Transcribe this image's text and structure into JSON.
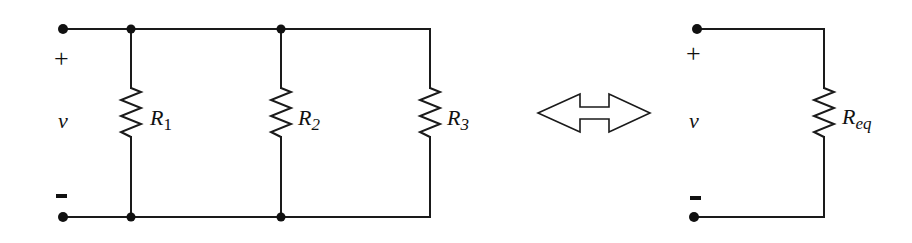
{
  "diagram": {
    "left_circuit": {
      "polarity_plus": "+",
      "polarity_minus": "-",
      "voltage_label": "v",
      "resistors": [
        {
          "name": "R",
          "subscript": "1"
        },
        {
          "name": "R",
          "subscript": "2"
        },
        {
          "name": "R",
          "subscript": "3"
        }
      ]
    },
    "equivalence_arrow": "double-headed hollow arrow",
    "right_circuit": {
      "polarity_plus": "+",
      "polarity_minus": "-",
      "voltage_label": "v",
      "resistor": {
        "name": "R",
        "subscript": "eq"
      }
    },
    "colors": {
      "line": "#1a1a1a",
      "background": "#ffffff"
    }
  }
}
